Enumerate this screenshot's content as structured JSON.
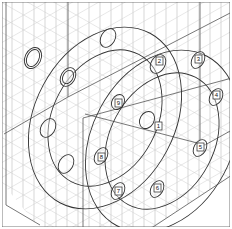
{
  "diagram": {
    "title": "",
    "type": "isometric flange bolt tightening sequence",
    "colors": {
      "background": "#ffffff",
      "grid": "#bdbdbd",
      "lines": "#333333"
    },
    "bolt_labels": [
      {
        "id": "1",
        "text": "1"
      },
      {
        "id": "2",
        "text": "2"
      },
      {
        "id": "3",
        "text": "3"
      },
      {
        "id": "4",
        "text": "4"
      },
      {
        "id": "5",
        "text": "5"
      },
      {
        "id": "6",
        "text": "6"
      },
      {
        "id": "7",
        "text": "7"
      },
      {
        "id": "8",
        "text": "8"
      },
      {
        "id": "9",
        "text": "9"
      }
    ]
  }
}
